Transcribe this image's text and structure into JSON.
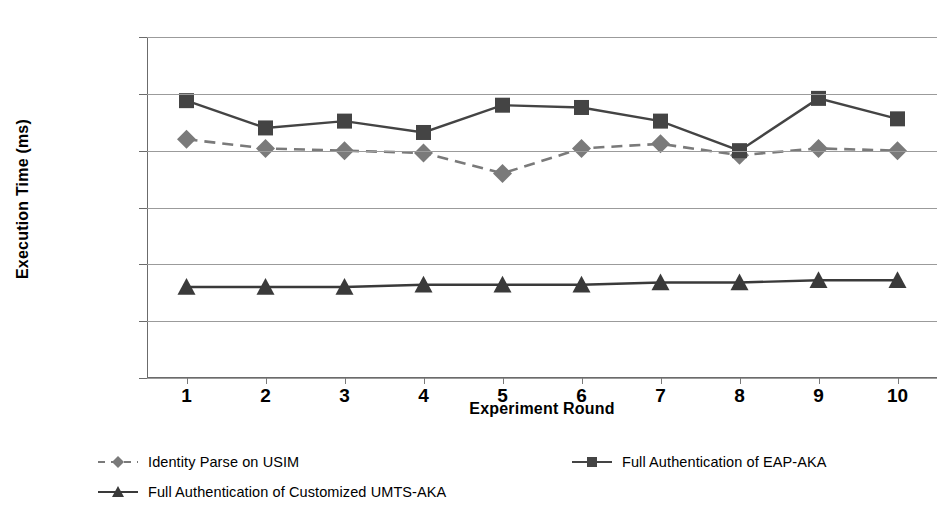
{
  "chart_data": {
    "type": "line",
    "title": "",
    "xlabel": "Experiment Round",
    "ylabel": "Execution Time (ms)",
    "x": [
      1,
      2,
      3,
      4,
      5,
      6,
      7,
      8,
      9,
      10
    ],
    "categories": [
      "1",
      "2",
      "3",
      "4",
      "5",
      "6",
      "7",
      "8",
      "9",
      "10"
    ],
    "xtick_labels": [
      "1",
      "2",
      "3",
      "4",
      "5",
      "6",
      "7",
      "8",
      "9",
      "10"
    ],
    "ytick_labels": [
      "250",
      "225",
      "200",
      "175",
      "150",
      "125",
      "100"
    ],
    "yticks": [
      250,
      225,
      200,
      175,
      150,
      125,
      100
    ],
    "ylim": [
      100,
      250
    ],
    "xlim": [
      0.5,
      10.5
    ],
    "grid": "horizontal",
    "legend_position": "bottom",
    "series": [
      {
        "name": "Identity Parse on USIM",
        "values": [
          205,
          201,
          200,
          199,
          190,
          201,
          203,
          198,
          201,
          200
        ],
        "marker": "diamond",
        "line_style": "dashed",
        "color": "#7a7a7a"
      },
      {
        "name": "Full Authentication of EAP-AKA",
        "values": [
          222,
          210,
          213,
          208,
          220,
          219,
          213,
          200,
          223,
          214
        ],
        "marker": "square",
        "line_style": "solid",
        "color": "#444444"
      },
      {
        "name": "Full Authentication of Customized UMTS-AKA",
        "values": [
          140,
          140,
          140,
          141,
          141,
          141,
          142,
          142,
          143,
          143
        ],
        "marker": "triangle",
        "line_style": "solid",
        "color": "#3a3a3a"
      }
    ]
  },
  "axes": {
    "y_title": "Execution Time (ms)",
    "x_title": "Experiment Round"
  },
  "legend": {
    "entries": [
      {
        "label": "Identity Parse on USIM"
      },
      {
        "label": "Full Authentication of EAP-AKA"
      },
      {
        "label": "Full Authentication of Customized UMTS-AKA"
      }
    ]
  },
  "colors": {
    "series_identity_parse": "#7a7a7a",
    "series_eap_aka": "#444444",
    "series_umts_aka": "#3a3a3a",
    "gridline": "#9b9b9b",
    "axis": "#6b6b6b",
    "background": "#ffffff",
    "text": "#000000"
  }
}
